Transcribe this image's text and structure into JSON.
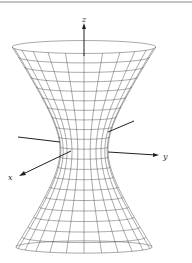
{
  "figure": {
    "axis_labels": {
      "x": "x",
      "y": "y",
      "z": "z"
    },
    "colors": {
      "mesh": "#555555",
      "axes": "#222222",
      "border": "#777777"
    }
  }
}
